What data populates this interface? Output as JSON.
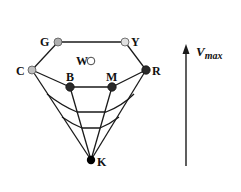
{
  "diagram": {
    "type": "color-solid-hexcone-cross-section",
    "nodes": [
      {
        "id": "G",
        "label": "G",
        "x": 58,
        "y": 42,
        "fill": "#b0b0b0"
      },
      {
        "id": "Y",
        "label": "Y",
        "x": 125,
        "y": 42,
        "fill": "#e0e0e0"
      },
      {
        "id": "C",
        "label": "C",
        "x": 32,
        "y": 70,
        "fill": "#c0c0c0"
      },
      {
        "id": "R",
        "label": "R",
        "x": 146,
        "y": 70,
        "fill": "#2a2a2a"
      },
      {
        "id": "B",
        "label": "B",
        "x": 70,
        "y": 87,
        "fill": "#2a2a2a"
      },
      {
        "id": "M",
        "label": "M",
        "x": 112,
        "y": 87,
        "fill": "#2a2a2a"
      },
      {
        "id": "W",
        "label": "W",
        "x": 91,
        "y": 61,
        "fill": "#ffffff"
      },
      {
        "id": "K",
        "label": "K",
        "x": 91,
        "y": 160,
        "fill": "#000000"
      }
    ],
    "edges": [
      [
        "G",
        "Y"
      ],
      [
        "Y",
        "R"
      ],
      [
        "R",
        "M"
      ],
      [
        "M",
        "B"
      ],
      [
        "B",
        "C"
      ],
      [
        "C",
        "G"
      ],
      [
        "C",
        "K"
      ],
      [
        "B",
        "K"
      ],
      [
        "M",
        "K"
      ],
      [
        "R",
        "K"
      ]
    ],
    "axis": {
      "label": "V",
      "subscript": "max",
      "direction": "up"
    }
  }
}
